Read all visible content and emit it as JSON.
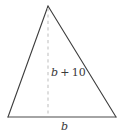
{
  "figure": {
    "type": "geometry-diagram",
    "shape": "triangle",
    "background_color": "#ffffff",
    "edge_color": "#3d3d3d",
    "base_color": "#4a4a4a",
    "dashed_color": "#c4c4c4",
    "text_color": "#3a3a3a",
    "labels": {
      "height": {
        "full_text": "b + 10",
        "variable": "b",
        "operator": "+",
        "constant": "10"
      },
      "base": {
        "full_text": "b",
        "variable": "b"
      }
    },
    "geometry": {
      "apex": [
        48,
        6
      ],
      "bottom_left": [
        8,
        117
      ],
      "bottom_right": [
        116,
        117
      ],
      "altitude_foot": [
        48,
        117
      ]
    }
  }
}
